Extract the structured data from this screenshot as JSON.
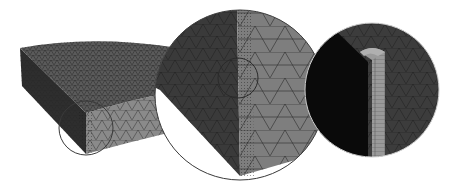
{
  "figure": {
    "colors": {
      "background": "#ffffff",
      "top_face": "#5c5c5c",
      "side_dark": "#2e2e2e",
      "side_light": "#8a8a8a",
      "mesh_line": "#1e1e1e",
      "circle_stroke": "#3a3a3a",
      "inset_black": "#0a0a0a",
      "inset_gray": "#3c3c3c",
      "boundary_layer": "#9a9a9a"
    },
    "panels": [
      {
        "name": "full-model",
        "shape": "quarter-disc slab"
      },
      {
        "name": "zoom-level-1",
        "center": [
          240,
          95
        ],
        "radius": 85
      },
      {
        "name": "zoom-level-2",
        "center": [
          372,
          90
        ],
        "radius": 67
      }
    ],
    "callouts": [
      {
        "name": "callout-corner",
        "center": [
          86,
          128
        ],
        "radius": 27
      },
      {
        "name": "callout-inner",
        "center": [
          238,
          78
        ],
        "radius": 20
      }
    ]
  }
}
